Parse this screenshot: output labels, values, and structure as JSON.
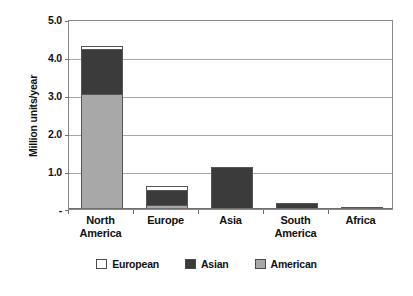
{
  "chart_data": {
    "type": "bar",
    "subtype": "stacked-vertical-bar",
    "title": "",
    "xlabel": "",
    "ylabel": "Million units/year",
    "ylim": [
      0,
      5.0
    ],
    "y_tick_values": [
      5.0,
      4.0,
      3.0,
      2.0,
      1.0,
      0
    ],
    "y_tick_labels": [
      "5.0",
      "4.0",
      "3.0",
      "2.0",
      "1.0",
      "-"
    ],
    "grid": true,
    "grid_axis": "y",
    "legend_position": "bottom-center",
    "categories": [
      "North America",
      "Europe",
      "Asia",
      "South America",
      "Africa"
    ],
    "category_labels_wrapped": [
      [
        "North",
        "America"
      ],
      [
        "Europe",
        ""
      ],
      [
        "Asia",
        ""
      ],
      [
        "South",
        "America"
      ],
      [
        "Africa",
        ""
      ]
    ],
    "series": [
      {
        "name": "American",
        "color": "#a8a8a8",
        "values": [
          3.03,
          0.1,
          0.0,
          0.0,
          0.0
        ]
      },
      {
        "name": "Asian",
        "color": "#3b3b3b",
        "values": [
          1.2,
          0.43,
          1.1,
          0.16,
          0.03
        ]
      },
      {
        "name": "European",
        "color": "#ffffff",
        "values": [
          0.11,
          0.14,
          0.0,
          0.0,
          0.0
        ]
      }
    ],
    "totals": [
      4.34,
      0.67,
      1.1,
      0.16,
      0.03
    ],
    "stack_order_bottom_to_top": [
      "American",
      "Asian",
      "European"
    ]
  },
  "legend": {
    "items": [
      {
        "label": "European",
        "color": "#ffffff"
      },
      {
        "label": "Asian",
        "color": "#3b3b3b"
      },
      {
        "label": "American",
        "color": "#a8a8a8"
      }
    ]
  },
  "colors": {
    "american": "#a8a8a8",
    "asian": "#3b3b3b",
    "european": "#ffffff",
    "axis": "#6f6f6f",
    "grid": "#a8a8a8",
    "border": "#555555",
    "text": "#111111"
  }
}
